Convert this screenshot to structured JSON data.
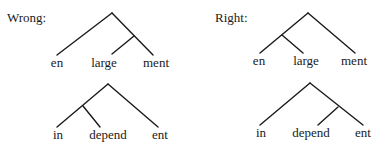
{
  "panels": {
    "wrong": {
      "title": "Wrong:"
    },
    "right": {
      "title": "Right:"
    }
  },
  "trees": [
    {
      "id": "wrong-enlargement",
      "panel": "wrong",
      "structure": "en [large ment]",
      "leaves": [
        "en",
        "large",
        "ment"
      ],
      "apex": [
        112,
        13
      ],
      "edges": [
        [
          112,
          13,
          57,
          55
        ],
        [
          112,
          13,
          153,
          55
        ],
        [
          134,
          36,
          112,
          54
        ]
      ],
      "label_x": [
        57,
        104,
        156
      ],
      "label_y": 67
    },
    {
      "id": "right-enlargement",
      "panel": "right",
      "structure": "[en large] ment",
      "leaves": [
        "en",
        "large",
        "ment"
      ],
      "apex": [
        308,
        13
      ],
      "edges": [
        [
          308,
          13,
          260,
          53
        ],
        [
          308,
          13,
          355,
          53
        ],
        [
          282,
          35,
          303,
          53
        ]
      ],
      "label_x": [
        259,
        306,
        354
      ],
      "label_y": 65
    },
    {
      "id": "wrong-independent",
      "panel": "wrong",
      "structure": "[in depend] ent",
      "leaves": [
        "in",
        "depend",
        "ent"
      ],
      "apex": [
        108,
        84
      ],
      "edges": [
        [
          108,
          84,
          57,
          127
        ],
        [
          108,
          84,
          158,
          127
        ],
        [
          83,
          106,
          100,
          127
        ]
      ],
      "label_x": [
        58,
        108,
        160
      ],
      "label_y": 139
    },
    {
      "id": "right-independent",
      "panel": "right",
      "structure": "in [depend ent]",
      "leaves": [
        "in",
        "depend",
        "ent"
      ],
      "apex": [
        310,
        83
      ],
      "edges": [
        [
          310,
          83,
          260,
          125
        ],
        [
          310,
          83,
          363,
          125
        ],
        [
          338,
          107,
          318,
          125
        ]
      ],
      "label_x": [
        261,
        311,
        363
      ],
      "label_y": 137
    }
  ]
}
